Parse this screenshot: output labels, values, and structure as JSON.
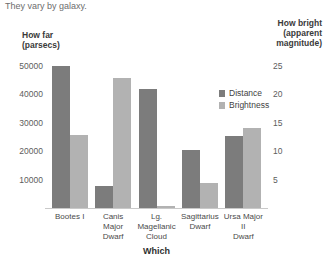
{
  "header": {
    "title": "DISTANCE AND BRIGHTNESS",
    "subtitle": "They vary by galaxy."
  },
  "legend": {
    "items": [
      {
        "label": "Distance",
        "color": "#7c7c7c"
      },
      {
        "label": "Brightness",
        "color": "#b2b2b2"
      }
    ]
  },
  "axes": {
    "left_title_line1": "How far",
    "left_title_line2": "(parsecs)",
    "right_title_line1": "How bright",
    "right_title_line2": "(apparent",
    "right_title_line3": "magnitude)",
    "x_title": "Which",
    "left_ticks": [
      "50,000",
      "40,000",
      "30,000",
      "20,000",
      "10,000"
    ],
    "right_ticks": [
      "25",
      "20",
      "15",
      "10",
      "5"
    ]
  },
  "categories": [
    {
      "line1": "Bootes I",
      "line2": ""
    },
    {
      "line1": "Canis Major",
      "line2": "Dwarf"
    },
    {
      "line1": "Lg. Magellanic",
      "line2": "Cloud"
    },
    {
      "line1": "Sagittarius",
      "line2": "Dwarf"
    },
    {
      "line1": "Ursa Major II",
      "line2": "Dwarf"
    }
  ],
  "chart_data": {
    "type": "bar",
    "title": "DISTANCE AND BRIGHTNESS",
    "subtitle": "They vary by galaxy.",
    "xlabel": "Which",
    "ylabel": "How far (parsecs)",
    "y2label": "How bright (apparent magnitude)",
    "grid": false,
    "legend_position": "inside-right",
    "ylim": [
      0,
      55000
    ],
    "y2lim": [
      0,
      27.5
    ],
    "yticks": [
      10000,
      20000,
      30000,
      40000,
      50000
    ],
    "y2ticks": [
      5,
      10,
      15,
      20,
      25
    ],
    "categories": [
      "Bootes I",
      "Canis Major Dwarf",
      "Lg. Magellanic Cloud",
      "Sagittarius Dwarf",
      "Ursa Major II Dwarf"
    ],
    "series": [
      {
        "name": "Distance",
        "axis": "left",
        "unit": "parsecs",
        "color": "#7c7c7c",
        "values": [
          50000,
          8000,
          42000,
          20500,
          25500
        ]
      },
      {
        "name": "Brightness",
        "axis": "right",
        "unit": "apparent magnitude",
        "color": "#b2b2b2",
        "values": [
          13.0,
          23.0,
          0.5,
          4.5,
          14.2
        ]
      }
    ]
  }
}
